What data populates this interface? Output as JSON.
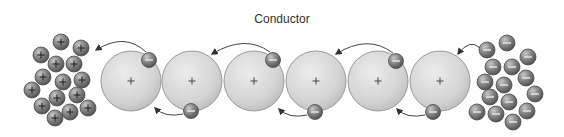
{
  "diagram": {
    "title": "Conductor",
    "labels": {
      "positive_sign": "+",
      "negative_sign": "−"
    },
    "colors": {
      "background": "#ffffff",
      "atom_fill": "#d6d6d6",
      "atom_stroke": "#9a9a9a",
      "particle_fill": "#7a7a7a",
      "particle_stroke": "#4a4a4a",
      "arrow": "#444444",
      "title": "#333333"
    },
    "atoms": [
      {
        "cx": 131,
        "cy": 81,
        "r": 30
      },
      {
        "cx": 192,
        "cy": 81,
        "r": 30
      },
      {
        "cx": 254,
        "cy": 81,
        "r": 30
      },
      {
        "cx": 316,
        "cy": 81,
        "r": 30
      },
      {
        "cx": 378,
        "cy": 81,
        "r": 30
      },
      {
        "cx": 440,
        "cy": 81,
        "r": 30
      }
    ],
    "conductor_electrons": [
      {
        "cx": 149,
        "cy": 60,
        "position": "top"
      },
      {
        "cx": 273,
        "cy": 60,
        "position": "top"
      },
      {
        "cx": 396,
        "cy": 61,
        "position": "top"
      },
      {
        "cx": 191,
        "cy": 111,
        "position": "bottom"
      },
      {
        "cx": 315,
        "cy": 112,
        "position": "bottom"
      },
      {
        "cx": 433,
        "cy": 112,
        "position": "bottom"
      }
    ],
    "positive_cluster": [
      {
        "cx": 61,
        "cy": 42
      },
      {
        "cx": 81,
        "cy": 48
      },
      {
        "cx": 41,
        "cy": 55
      },
      {
        "cx": 56,
        "cy": 64
      },
      {
        "cx": 74,
        "cy": 64
      },
      {
        "cx": 43,
        "cy": 77
      },
      {
        "cx": 63,
        "cy": 82
      },
      {
        "cx": 82,
        "cy": 80
      },
      {
        "cx": 32,
        "cy": 90
      },
      {
        "cx": 57,
        "cy": 98
      },
      {
        "cx": 77,
        "cy": 95
      },
      {
        "cx": 42,
        "cy": 106
      },
      {
        "cx": 70,
        "cy": 112
      },
      {
        "cx": 88,
        "cy": 108
      },
      {
        "cx": 55,
        "cy": 118
      }
    ],
    "negative_cluster": [
      {
        "cx": 507,
        "cy": 43
      },
      {
        "cx": 487,
        "cy": 50
      },
      {
        "cx": 528,
        "cy": 57
      },
      {
        "cx": 493,
        "cy": 67
      },
      {
        "cx": 512,
        "cy": 67
      },
      {
        "cx": 526,
        "cy": 78
      },
      {
        "cx": 485,
        "cy": 82
      },
      {
        "cx": 504,
        "cy": 85
      },
      {
        "cx": 535,
        "cy": 94
      },
      {
        "cx": 490,
        "cy": 97
      },
      {
        "cx": 509,
        "cy": 102
      },
      {
        "cx": 477,
        "cy": 112
      },
      {
        "cx": 496,
        "cy": 114
      },
      {
        "cx": 527,
        "cy": 111
      },
      {
        "cx": 513,
        "cy": 122
      }
    ],
    "arrows": [
      {
        "d": "M146,52 Q125,32 96,50",
        "tip": [
          94,
          52
        ]
      },
      {
        "d": "M270,52 Q245,34 212,54",
        "tip": [
          210,
          56
        ]
      },
      {
        "d": "M393,53 Q368,34 336,54",
        "tip": [
          334,
          56
        ]
      },
      {
        "d": "M480,48 Q470,38 458,54",
        "tip": [
          456,
          57
        ]
      },
      {
        "d": "M183,114 Q165,118 155,108",
        "tip": [
          153,
          106
        ]
      },
      {
        "d": "M307,115 Q289,119 279,109",
        "tip": [
          277,
          107
        ]
      },
      {
        "d": "M425,115 Q407,119 397,109",
        "tip": [
          395,
          107
        ]
      }
    ]
  }
}
